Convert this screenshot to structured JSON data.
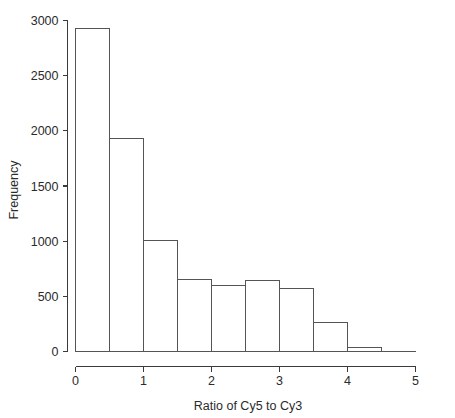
{
  "chart_data": {
    "type": "bar",
    "title": "",
    "xlabel": "Ratio of Cy5 to Cy3",
    "ylabel": "Frequency",
    "categories": [
      "0-0.5",
      "0.5-1",
      "1-1.5",
      "1.5-2",
      "2-2.5",
      "2.5-3",
      "3-3.5",
      "3.5-4",
      "4-4.5"
    ],
    "bin_edges": [
      0,
      0.5,
      1,
      1.5,
      2,
      2.5,
      3,
      3.5,
      4,
      4.5
    ],
    "bin_width": 0.5,
    "values": [
      2930,
      1930,
      1010,
      650,
      595,
      645,
      570,
      260,
      35
    ],
    "xlim": [
      0,
      5
    ],
    "ylim": [
      0,
      3000
    ],
    "xticks": [
      0,
      1,
      2,
      3,
      4,
      5
    ],
    "xtick_labels": [
      "0",
      "1",
      "2",
      "3",
      "4",
      "5"
    ],
    "yticks": [
      0,
      500,
      1000,
      1500,
      2000,
      2500,
      3000
    ],
    "ytick_labels": [
      "0",
      "500",
      "1000",
      "1500",
      "2000",
      "2500",
      "3000"
    ],
    "grid": false,
    "legend": false,
    "bar_fill": "#ffffff",
    "bar_stroke": "#555555",
    "axis_color": "#3a3a3a"
  },
  "axes": {
    "x_title": "Ratio of Cy5 to Cy3",
    "y_title": "Frequency"
  }
}
